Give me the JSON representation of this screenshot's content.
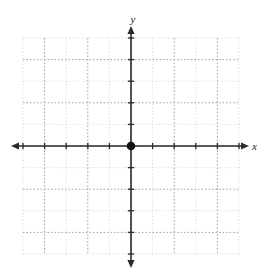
{
  "chart_data": {
    "type": "scatter",
    "title": "",
    "subtitle": "",
    "xlabel": "x",
    "ylabel": "y",
    "xlim": [
      -5,
      5
    ],
    "ylim": [
      -5,
      5
    ],
    "x_ticks": [
      -5,
      -4,
      -3,
      -2,
      -1,
      1,
      2,
      3,
      4,
      5
    ],
    "y_ticks": [
      -5,
      -4,
      -3,
      -2,
      -1,
      1,
      2,
      3,
      4,
      5
    ],
    "x_tick_labels": [],
    "y_tick_labels": [],
    "grid": true,
    "grid_style": "dotted",
    "legend": null,
    "legend_position": "none",
    "annotations": [],
    "series": [
      {
        "name": "origin-point",
        "points": [
          {
            "x": 0,
            "y": 0
          }
        ]
      }
    ]
  },
  "figure": {
    "canvas_width": 260,
    "canvas_height": 274,
    "origin_px": {
      "x": 131,
      "y": 146
    },
    "cell_px": 21.6,
    "grid_left_px": 23,
    "grid_right_px": 239,
    "grid_top_px": 38,
    "grid_bottom_px": 254,
    "x_axis_start_px": 11,
    "x_axis_end_px": 249,
    "y_axis_start_px": 26,
    "y_axis_end_px": 268
  },
  "labels": {
    "y_axis": "y",
    "x_axis": "x"
  },
  "colors": {
    "background": "#ffffff",
    "axis": "#2b2b2b",
    "grid_major": "#9a9a9a",
    "grid_minor": "#c9c9c9",
    "point_fill": "#111111",
    "label_text": "#1a1a1a"
  },
  "accessibility": {
    "description": "Blank Cartesian coordinate grid with dotted gridlines, labeled x and y axes, tick marks, and a filled point plotted at the origin."
  }
}
